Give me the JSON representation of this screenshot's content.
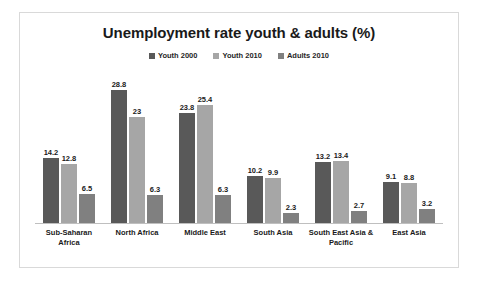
{
  "chart_data": {
    "type": "bar",
    "title": "Unemployment rate youth & adults (%)",
    "xlabel": "",
    "ylabel": "",
    "ylim": [
      0,
      30
    ],
    "grid": false,
    "legend_position": "top-center",
    "categories": [
      "Sub-Saharan Africa",
      "North Africa",
      "Middle East",
      "South Asia",
      "South East Asia & Pacific",
      "East Asia"
    ],
    "series": [
      {
        "name": "Youth 2000",
        "color": "#595959",
        "values": [
          14.2,
          28.8,
          23.8,
          10.2,
          13.2,
          9.1
        ]
      },
      {
        "name": "Youth 2010",
        "color": "#a6a6a6",
        "values": [
          12.8,
          23,
          25.4,
          9.9,
          13.4,
          8.8
        ]
      },
      {
        "name": "Adults 2010",
        "color": "#808080",
        "values": [
          6.5,
          6.3,
          6.3,
          2.3,
          2.7,
          3.2
        ]
      }
    ]
  },
  "style": {
    "frame_border_color": "#d9d9d9",
    "axis_line_color": "#bfbfbf",
    "background": "#ffffff",
    "title_color": "#1a1a1a"
  }
}
